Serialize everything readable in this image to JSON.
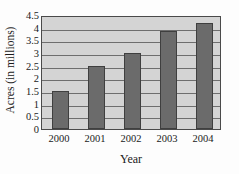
{
  "chart_data": {
    "type": "bar",
    "title": "",
    "categories": [
      "2000",
      "2001",
      "2002",
      "2003",
      "2004"
    ],
    "values": [
      1.5,
      2.5,
      3.0,
      3.85,
      4.2
    ],
    "series": [
      {
        "name": "Acres",
        "values": [
          1.5,
          2.5,
          3.0,
          3.85,
          4.2
        ]
      }
    ],
    "xlabel": "Year",
    "ylabel": "Acres (in millions)",
    "ylim": [
      0,
      4.5
    ],
    "yticks": [
      "0",
      "0.5",
      "1",
      "1.5",
      "2",
      "2.5",
      "3",
      "3.5",
      "4",
      "4.5"
    ],
    "ytick_values": [
      0,
      0.5,
      1,
      1.5,
      2,
      2.5,
      3,
      3.5,
      4,
      4.5
    ],
    "grid": true,
    "grid_axis": "y",
    "legend": false,
    "legend_position": "none",
    "colors": {
      "bar_fill": "#6b6b6b",
      "bar_edge": "#3f3f3f",
      "plot_background": "#d4d4d4",
      "gridline": "#6e6e6e",
      "axis_border": "#4a4a4a",
      "figure_background": "#fdfdfd",
      "text": "#1a1a1a"
    }
  }
}
